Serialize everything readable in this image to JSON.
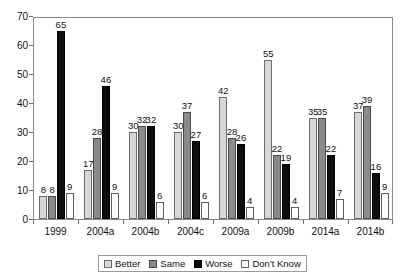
{
  "chart_data": {
    "type": "bar",
    "title": "",
    "subtitle": "",
    "xlabel": "",
    "ylabel": "",
    "ylim": [
      0,
      70
    ],
    "yticks": [
      0,
      10,
      20,
      30,
      40,
      50,
      60,
      70
    ],
    "grid": false,
    "legend_position": "bottom",
    "categories": [
      "1999",
      "2004a",
      "2004b",
      "2004c",
      "2009a",
      "2009b",
      "2014a",
      "2014b"
    ],
    "series": [
      {
        "name": "Better",
        "color": "#d7d7d7",
        "values": [
          8,
          17,
          30,
          30,
          42,
          55,
          35,
          37
        ]
      },
      {
        "name": "Same",
        "color": "#8b8b8b",
        "values": [
          8,
          28,
          32,
          37,
          28,
          22,
          35,
          39
        ]
      },
      {
        "name": "Worse",
        "color": "#0d0d0d",
        "values": [
          65,
          46,
          32,
          27,
          26,
          19,
          22,
          16
        ]
      },
      {
        "name": "Don't Know",
        "color": "#ffffff",
        "values": [
          9,
          9,
          6,
          6,
          4,
          4,
          7,
          9
        ]
      }
    ]
  },
  "legend": {
    "items": [
      {
        "label": "Better",
        "key": "better"
      },
      {
        "label": "Same",
        "key": "same"
      },
      {
        "label": "Worse",
        "key": "worse"
      },
      {
        "label": "Don't Know",
        "key": "dontknow"
      }
    ]
  }
}
